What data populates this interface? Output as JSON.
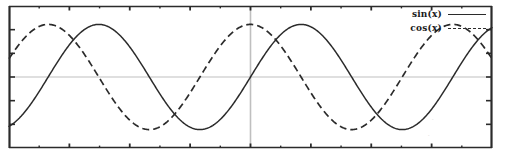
{
  "chart_data": {
    "type": "line",
    "title": "",
    "subtitle": "",
    "xlabel": "",
    "ylabel": "",
    "xlim": [
      -7.5,
      7.5
    ],
    "ylim": [
      -1.35,
      1.35
    ],
    "grid": false,
    "legend_position": "top-right",
    "axis_lines": {
      "x_zero": 0,
      "y_zero": 0
    },
    "x": [
      -7.5,
      -7.0,
      -6.5,
      -6.0,
      -5.5,
      -5.0,
      -4.5,
      -4.0,
      -3.5,
      -3.0,
      -2.5,
      -2.0,
      -1.5,
      -1.0,
      -0.5,
      0.0,
      0.5,
      1.0,
      1.5,
      2.0,
      2.5,
      3.0,
      3.5,
      4.0,
      4.5,
      5.0,
      5.5,
      6.0,
      6.5,
      7.0,
      7.5
    ],
    "series": [
      {
        "name": "sin(x)",
        "style": "solid",
        "color": "#2b2b2b",
        "values": [
          -0.938,
          -0.657,
          -0.216,
          0.279,
          0.706,
          0.959,
          0.978,
          0.757,
          0.351,
          -0.141,
          -0.598,
          -0.909,
          -0.997,
          -0.841,
          -0.479,
          0.0,
          0.479,
          0.841,
          0.997,
          0.909,
          0.598,
          0.141,
          -0.351,
          -0.757,
          -0.978,
          -0.959,
          -0.706,
          -0.279,
          0.216,
          0.657,
          0.938
        ]
      },
      {
        "name": "cos(x)",
        "style": "dashed",
        "color": "#2b2b2b",
        "values": [
          0.347,
          0.754,
          0.977,
          0.96,
          0.709,
          0.284,
          -0.211,
          -0.654,
          -0.936,
          -0.99,
          -0.801,
          -0.416,
          0.071,
          0.54,
          0.878,
          1.0,
          0.878,
          0.54,
          0.071,
          -0.416,
          -0.801,
          -0.99,
          -0.936,
          -0.654,
          -0.211,
          0.284,
          0.709,
          0.96,
          0.977,
          0.754,
          0.347
        ]
      }
    ],
    "x_ticks_major_count": 9,
    "x_ticks_minor_count": 8,
    "y_ticks_major_count": 7
  },
  "legend": {
    "entries": [
      {
        "label": "sin(x)",
        "style": "solid"
      },
      {
        "label": "cos(x)",
        "style": "dashed"
      }
    ]
  },
  "colors": {
    "background": "#ffffff",
    "frame": "#2b2b2b",
    "curve": "#2b2b2b",
    "axis_line": "#bfbfbf",
    "tick": "#2b2b2b"
  },
  "artifacts": {
    "smudge_one": "·",
    "smudge_two": "·"
  }
}
